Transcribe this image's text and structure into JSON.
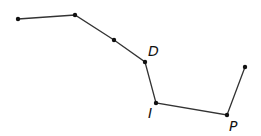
{
  "diagram": {
    "type": "polyline",
    "stroke_color": "#333333",
    "point_color": "#111111",
    "points": [
      {
        "x": 18,
        "y": 19,
        "label": ""
      },
      {
        "x": 75,
        "y": 15,
        "label": ""
      },
      {
        "x": 114,
        "y": 40,
        "label": ""
      },
      {
        "x": 145,
        "y": 62,
        "label": "D"
      },
      {
        "x": 156,
        "y": 103,
        "label": "I"
      },
      {
        "x": 227,
        "y": 115,
        "label": "P"
      },
      {
        "x": 245,
        "y": 67,
        "label": ""
      }
    ],
    "labels": {
      "D": "D",
      "I": "I",
      "P": "P"
    }
  }
}
